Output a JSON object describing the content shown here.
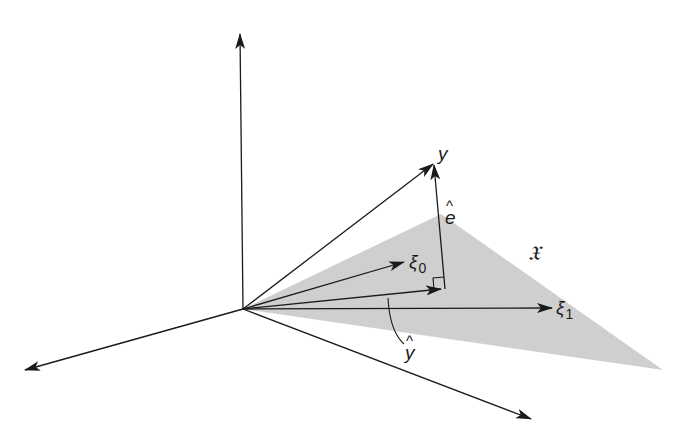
{
  "figure": {
    "colors": {
      "background": "#ffffff",
      "line": "#1a1a1a",
      "plane_fill": "#cfcfcf"
    },
    "labels": {
      "y": "y",
      "e_hat_letter": "e",
      "e_hat_accent": "^",
      "xi0_symbol": "ξ",
      "xi0_sub": "0",
      "xi1_symbol": "ξ",
      "xi1_sub": "1",
      "y_hat_letter": "y",
      "y_hat_accent": "^",
      "subspace": "𝔛"
    },
    "elements": {
      "axes": [
        "vertical-axis",
        "left-axis",
        "right-axis"
      ],
      "vectors": [
        "y",
        "xi_0",
        "xi_1",
        "y_hat",
        "e_hat"
      ],
      "plane": "𝔛 (shaded triangle)",
      "right_angle_marker": true
    }
  }
}
